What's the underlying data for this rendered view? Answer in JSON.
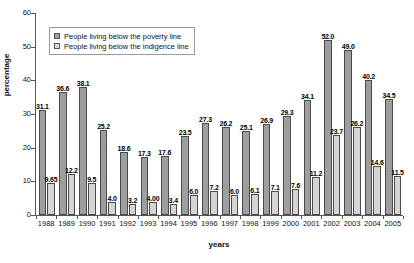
{
  "chart_data": {
    "type": "bar",
    "title": "",
    "xlabel": "years",
    "ylabel": "percentage",
    "ylim": [
      0,
      60
    ],
    "yticks": [
      0,
      10,
      20,
      30,
      40,
      50,
      60
    ],
    "grid": false,
    "legend_position": "top-left",
    "categories": [
      "1988",
      "1989",
      "1990",
      "1991",
      "1992",
      "1993",
      "1994",
      "1995",
      "1996",
      "1997",
      "1998",
      "1999",
      "2000",
      "2001",
      "2002",
      "2003",
      "2004",
      "2005"
    ],
    "series": [
      {
        "name": "People living below the poverty line",
        "color": "#9e9e9e",
        "values": [
          31.1,
          36.6,
          38.1,
          25.2,
          18.6,
          17.3,
          17.6,
          23.5,
          27.3,
          26.2,
          25.1,
          26.9,
          29.3,
          34.1,
          52.0,
          49.0,
          40.2,
          34.5
        ],
        "labels": [
          "31.1",
          "36.6",
          "38.1",
          "25.2",
          "18.6",
          "17.3",
          "17.6",
          "23.5",
          "27.3",
          "26.2",
          "25.1",
          "26.9",
          "29.3",
          "34.1",
          "52.0",
          "49.0",
          "40.2",
          "34.5"
        ]
      },
      {
        "name": "People living below the indigence line",
        "color": "#d5d5d5",
        "values": [
          9.65,
          12.2,
          9.5,
          4.0,
          3.2,
          4.0,
          3.4,
          6.0,
          7.2,
          6.0,
          6.1,
          7.1,
          7.6,
          11.2,
          23.7,
          26.2,
          14.6,
          11.5
        ],
        "labels": [
          "9.65",
          "12.2",
          "9.5",
          "4.0",
          "3.2",
          "4.00",
          "3.4",
          "6.0",
          "7.2",
          "6.0",
          "6.1",
          "7.1",
          "7.6",
          "11.2",
          "23.7",
          "26.2",
          "14.6",
          "11.5"
        ]
      }
    ]
  },
  "legend": {
    "items": [
      {
        "label": "People living below the poverty line"
      },
      {
        "label": "People living below the indigence line"
      }
    ]
  }
}
